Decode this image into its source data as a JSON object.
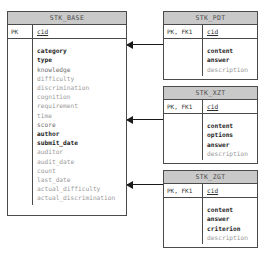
{
  "diagram": {
    "colors": {
      "header_fill": "#c9c9c9",
      "border": "#4a4a4a",
      "connector": "#1a1a1a",
      "text": "#3a3a3a",
      "faint_text": "#9a9a9a"
    }
  },
  "entities": [
    {
      "id": "stk-base",
      "name": "STK_BASE",
      "key_label": "PK",
      "key_attribute": "cid",
      "attributes": [
        {
          "name": "category",
          "emphasis": "strong"
        },
        {
          "name": "type",
          "emphasis": "strong"
        },
        {
          "name": "knowledge",
          "emphasis": "mid"
        },
        {
          "name": "difficulty",
          "emphasis": "faint"
        },
        {
          "name": "discrimination",
          "emphasis": "faint"
        },
        {
          "name": "cognition",
          "emphasis": "faint"
        },
        {
          "name": "requirement",
          "emphasis": "faint"
        },
        {
          "name": "time",
          "emphasis": "faint"
        },
        {
          "name": "score",
          "emphasis": "mid"
        },
        {
          "name": "author",
          "emphasis": "strong"
        },
        {
          "name": "submit_date",
          "emphasis": "strong"
        },
        {
          "name": "auditor",
          "emphasis": "faint"
        },
        {
          "name": "audit_date",
          "emphasis": "faint"
        },
        {
          "name": "count",
          "emphasis": "faint"
        },
        {
          "name": "last_date",
          "emphasis": "faint"
        },
        {
          "name": "actual_difficulty",
          "emphasis": "faint"
        },
        {
          "name": "actual_discrimination",
          "emphasis": "faint"
        }
      ]
    },
    {
      "id": "stk-pdt",
      "name": "STK_PDT",
      "key_label": "PK, FK1",
      "key_attribute": "cid",
      "attributes": [
        {
          "name": "content",
          "emphasis": "strong"
        },
        {
          "name": "answer",
          "emphasis": "strong"
        },
        {
          "name": "description",
          "emphasis": "faint"
        }
      ]
    },
    {
      "id": "stk-xzt",
      "name": "STK_XZT",
      "key_label": "PK, FK1",
      "key_attribute": "cid",
      "attributes": [
        {
          "name": "content",
          "emphasis": "strong"
        },
        {
          "name": "options",
          "emphasis": "strong"
        },
        {
          "name": "answer",
          "emphasis": "strong"
        },
        {
          "name": "description",
          "emphasis": "faint"
        }
      ]
    },
    {
      "id": "stk-zgt",
      "name": "STK_ZGT",
      "key_label": "PK, FK1",
      "key_attribute": "cid",
      "attributes": [
        {
          "name": "content",
          "emphasis": "strong"
        },
        {
          "name": "answer",
          "emphasis": "strong"
        },
        {
          "name": "criterion",
          "emphasis": "strong"
        },
        {
          "name": "description",
          "emphasis": "faint"
        }
      ]
    }
  ],
  "relationships": [
    {
      "id": "rel-base-pdt",
      "from": "STK_PDT",
      "to": "STK_BASE",
      "via": "cid"
    },
    {
      "id": "rel-base-xzt",
      "from": "STK_XZT",
      "to": "STK_BASE",
      "via": "cid"
    },
    {
      "id": "rel-base-zgt",
      "from": "STK_ZGT",
      "to": "STK_BASE",
      "via": "cid"
    }
  ]
}
